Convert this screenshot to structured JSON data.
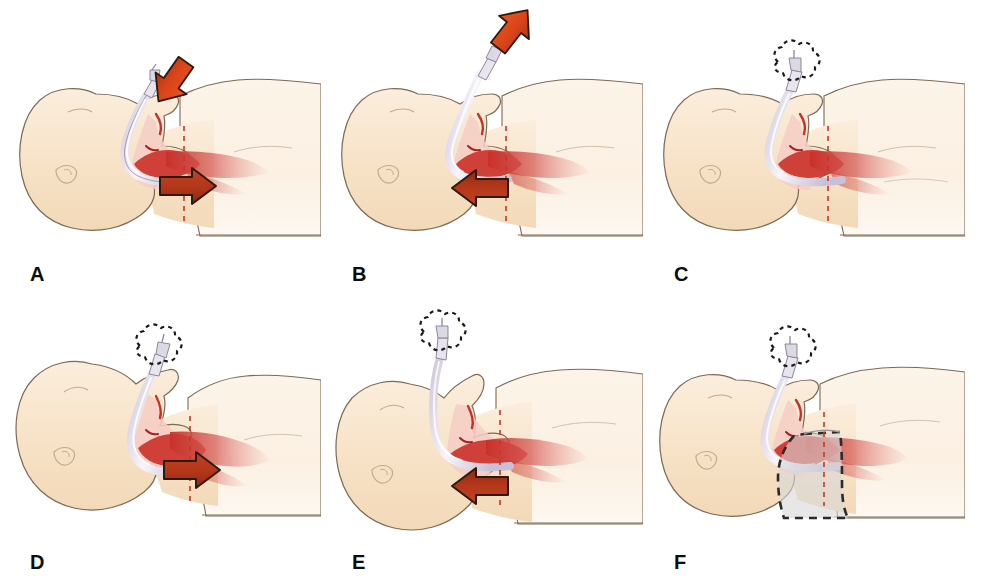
{
  "figure": {
    "width": 1003,
    "height": 576,
    "background_color": "#ffffff",
    "rows": 2,
    "columns": 3
  },
  "colors": {
    "skin_fill": "#f7e2c6",
    "skin_fill_light": "#fbeedd",
    "skin_outline": "#7d6a55",
    "torso_fill": "#fdf4e9",
    "airway_red": "#c8302a",
    "airway_red_dark": "#a81f1f",
    "airway_pink": "#e89a92",
    "tongue_red": "#cf4038",
    "tube_white": "#f4f2f8",
    "tube_lavender": "#cfc8dd",
    "tube_outline": "#8c8799",
    "arrow_bright": "#d9441a",
    "arrow_dark": "#b03518",
    "arrow_outline": "#2b1a10",
    "dashed_trachea": "#c0392b",
    "dashed_black": "#1a1a1a",
    "collar_fill": "#d8d8d8",
    "collar_outline": "#2b2b2b",
    "label_color": "#0d0d0d"
  },
  "panels": [
    {
      "id": "a",
      "label": "A",
      "caption": "Neutral head position with tube advanced: downward force on tube and tube tip moves toward the carina",
      "head_position": "neutral",
      "connector_state": "connected",
      "collar": false,
      "arrows": [
        {
          "name": "tube-push-arrow",
          "direction": "down-left",
          "angle_deg": 215,
          "style": "bright",
          "meaning": "downward pressure applied to endotracheal tube"
        },
        {
          "name": "tube-tip-advance-arrow",
          "direction": "right",
          "angle_deg": 0,
          "style": "dark",
          "meaning": "tube tip advances toward carina"
        }
      ]
    },
    {
      "id": "b",
      "label": "B",
      "caption": "Neutral head position with tube withdrawn: upward traction on tube and tube tip moves away from the carina",
      "head_position": "neutral",
      "connector_state": "connected",
      "collar": false,
      "arrows": [
        {
          "name": "tube-pull-arrow",
          "direction": "up-right",
          "angle_deg": 42,
          "style": "bright",
          "meaning": "upward traction applied to endotracheal tube"
        },
        {
          "name": "tube-tip-withdraw-arrow",
          "direction": "left",
          "angle_deg": 180,
          "style": "dark",
          "meaning": "tube tip withdraws away from carina"
        }
      ]
    },
    {
      "id": "c",
      "label": "C",
      "caption": "Neutral head position with tube disconnected from the circuit; tube tip remains at baseline depth",
      "head_position": "neutral",
      "connector_state": "disconnected",
      "collar": false,
      "arrows": []
    },
    {
      "id": "d",
      "label": "D",
      "caption": "Head flexion: chin moves toward the chest and the tube tip advances toward the carina",
      "head_position": "flexed",
      "connector_state": "disconnected",
      "collar": false,
      "arrows": [
        {
          "name": "tube-tip-advance-arrow",
          "direction": "right",
          "angle_deg": 0,
          "style": "dark",
          "meaning": "tube tip advances toward carina with neck flexion"
        }
      ]
    },
    {
      "id": "e",
      "label": "E",
      "caption": "Head extension: chin moves away from the chest and the tube tip withdraws away from the carina",
      "head_position": "extended",
      "connector_state": "disconnected",
      "collar": false,
      "arrows": [
        {
          "name": "tube-tip-withdraw-arrow",
          "direction": "left",
          "angle_deg": 180,
          "style": "dark",
          "meaning": "tube tip withdraws away from carina with neck extension"
        }
      ]
    },
    {
      "id": "f",
      "label": "F",
      "caption": "Rigid cervical collar applied: head and neck immobilized so tube tip position is maintained",
      "head_position": "neutral",
      "connector_state": "disconnected",
      "collar": true,
      "collar_label": "cervical-collar",
      "arrows": []
    }
  ]
}
